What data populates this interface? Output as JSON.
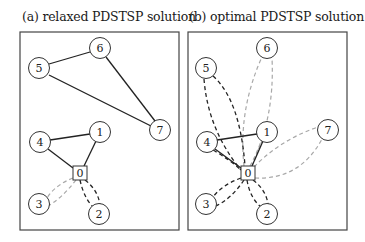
{
  "panels": [
    {
      "id": "a",
      "caption": "(a) relaxed PDSTSP solution",
      "frame": {
        "x": 20,
        "y": 32,
        "w": 159,
        "h": 198
      },
      "nodes": [
        {
          "id": "0",
          "label": "0",
          "shape": "square",
          "x": 80,
          "y": 173
        },
        {
          "id": "1",
          "label": "1",
          "shape": "circle",
          "x": 100,
          "y": 132
        },
        {
          "id": "2",
          "label": "2",
          "shape": "circle",
          "x": 99,
          "y": 214
        },
        {
          "id": "3",
          "label": "3",
          "shape": "circle",
          "x": 39,
          "y": 204
        },
        {
          "id": "4",
          "label": "4",
          "shape": "circle",
          "x": 40,
          "y": 142
        },
        {
          "id": "5",
          "label": "5",
          "shape": "circle",
          "x": 39,
          "y": 68
        },
        {
          "id": "6",
          "label": "6",
          "shape": "circle",
          "x": 100,
          "y": 48
        },
        {
          "id": "7",
          "label": "7",
          "shape": "circle",
          "x": 160,
          "y": 130
        }
      ],
      "edges": [
        {
          "from": "5",
          "to": "6",
          "style": "solid"
        },
        {
          "from": "6",
          "to": "7",
          "style": "solid"
        },
        {
          "from": "5",
          "to": "7",
          "style": "solid"
        },
        {
          "from": "4",
          "to": "1",
          "style": "solid"
        },
        {
          "from": "1",
          "to": "0",
          "style": "solid"
        },
        {
          "from": "4",
          "to": "0",
          "style": "solid"
        },
        {
          "from": "0",
          "to": "3",
          "style": "light-dashed-loop"
        },
        {
          "from": "0",
          "to": "2",
          "style": "dark-dashed-loop"
        }
      ]
    },
    {
      "id": "b",
      "caption": "(b) optimal PDSTSP solution",
      "frame": {
        "x": 188,
        "y": 32,
        "w": 159,
        "h": 198
      },
      "nodes": [
        {
          "id": "0",
          "label": "0",
          "shape": "square",
          "x": 248,
          "y": 173
        },
        {
          "id": "1",
          "label": "1",
          "shape": "circle",
          "x": 267,
          "y": 132
        },
        {
          "id": "2",
          "label": "2",
          "shape": "circle",
          "x": 267,
          "y": 214
        },
        {
          "id": "3",
          "label": "3",
          "shape": "circle",
          "x": 206,
          "y": 204
        },
        {
          "id": "4",
          "label": "4",
          "shape": "circle",
          "x": 207,
          "y": 142
        },
        {
          "id": "5",
          "label": "5",
          "shape": "circle",
          "x": 206,
          "y": 68
        },
        {
          "id": "6",
          "label": "6",
          "shape": "circle",
          "x": 267,
          "y": 48
        },
        {
          "id": "7",
          "label": "7",
          "shape": "circle",
          "x": 328,
          "y": 130
        }
      ],
      "edges": [
        {
          "from": "4",
          "to": "1",
          "style": "solid"
        },
        {
          "from": "1",
          "to": "0",
          "style": "solid"
        },
        {
          "from": "4",
          "to": "0",
          "style": "solid"
        },
        {
          "from": "0",
          "to": "4",
          "style": "dark-dashed-loop"
        },
        {
          "from": "0",
          "to": "5",
          "style": "dark-dashed-loop"
        },
        {
          "from": "0",
          "to": "3",
          "style": "dark-dashed-loop"
        },
        {
          "from": "0",
          "to": "2",
          "style": "dark-dashed-loop"
        },
        {
          "from": "0",
          "to": "6",
          "style": "light-dashed-loop"
        },
        {
          "from": "0",
          "to": "7",
          "style": "light-dashed-loop"
        },
        {
          "from": "0",
          "to": "1",
          "style": "light-dashed-loop"
        }
      ]
    }
  ],
  "legend_colors": {
    "solid": "#222222",
    "dark_dashed": "#222222",
    "light_dashed": "#a8a8a8",
    "frame": "#444444"
  }
}
